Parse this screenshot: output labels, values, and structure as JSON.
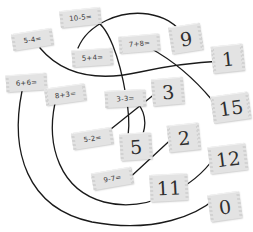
{
  "worksheet": {
    "kind": "math-matching-exercise",
    "ink_color": "#1a1a1a",
    "card_color": "#e3e3e3",
    "text_color": "#3b3b3b"
  },
  "equation_cards": [
    {
      "id": "eq-10-5",
      "label": "10-5=",
      "x": 60,
      "y": 9,
      "rot": -6
    },
    {
      "id": "eq-5-4",
      "label": "5-4=",
      "x": 12,
      "y": 31,
      "rot": -9
    },
    {
      "id": "eq-5p4",
      "label": "5+4=",
      "x": 72,
      "y": 49,
      "rot": -4
    },
    {
      "id": "eq-7p8",
      "label": "7+8=",
      "x": 119,
      "y": 35,
      "rot": -5
    },
    {
      "id": "eq-6p6",
      "label": "6+6=",
      "x": 6,
      "y": 74,
      "rot": -4
    },
    {
      "id": "eq-8p3",
      "label": "8+3=",
      "x": 45,
      "y": 86,
      "rot": -8
    },
    {
      "id": "eq-3-3",
      "label": "3-3=",
      "x": 105,
      "y": 90,
      "rot": -3
    },
    {
      "id": "eq-5-2",
      "label": "5-2=",
      "x": 72,
      "y": 130,
      "rot": -9
    },
    {
      "id": "eq-9-7",
      "label": "9-7=",
      "x": 92,
      "y": 170,
      "rot": -10
    }
  ],
  "answer_cards": [
    {
      "id": "ans-9",
      "label": "9",
      "x": 170,
      "y": 25,
      "rot": -9,
      "wide": false
    },
    {
      "id": "ans-1",
      "label": "1",
      "x": 212,
      "y": 45,
      "rot": -6,
      "wide": false
    },
    {
      "id": "ans-3",
      "label": "3",
      "x": 152,
      "y": 78,
      "rot": -5,
      "wide": false
    },
    {
      "id": "ans-15",
      "label": "15",
      "x": 212,
      "y": 94,
      "rot": -8,
      "wide": true
    },
    {
      "id": "ans-5",
      "label": "5",
      "x": 120,
      "y": 133,
      "rot": -4,
      "wide": false
    },
    {
      "id": "ans-2",
      "label": "2",
      "x": 168,
      "y": 124,
      "rot": -6,
      "wide": false
    },
    {
      "id": "ans-12",
      "label": "12",
      "x": 209,
      "y": 145,
      "rot": -7,
      "wide": true
    },
    {
      "id": "ans-11",
      "label": "11",
      "x": 150,
      "y": 174,
      "rot": -3,
      "wide": true
    },
    {
      "id": "ans-0",
      "label": "0",
      "x": 209,
      "y": 193,
      "rot": -8,
      "wide": false
    }
  ],
  "connections": [
    {
      "id": "link-10-5-to-5",
      "from": "10-5=",
      "to": "5",
      "path": "M 92,20 C 108,22 120,60 126,96 C 131,124 128,133 128,136"
    },
    {
      "id": "link-5p4-to-9",
      "from": "5+4=",
      "to": "9",
      "path": "M 78,48 C 88,24 120,10 148,14 C 166,17 174,24 180,30"
    },
    {
      "id": "link-7p8-to-15",
      "from": "7+8=",
      "to": "15",
      "path": "M 150,48 C 172,60 192,76 212,100"
    },
    {
      "id": "link-5-4-to-1",
      "from": "5-4=",
      "to": "1",
      "path": "M 40,48 C 62,74 96,82 140,72 C 176,64 202,62 222,61"
    },
    {
      "id": "link-3-3-to-5",
      "from": "3-3=",
      "to": "5",
      "path": "M 131,99 C 142,104 148,118 143,134 C 140,142 139,144 138,146"
    },
    {
      "id": "link-5-2-to-3",
      "from": "5-2=",
      "to": "3",
      "path": "M 101,137 L 166,85"
    },
    {
      "id": "link-9-7-to-2",
      "from": "9-7=",
      "to": "2",
      "path": "M 125,182 L 178,133"
    },
    {
      "id": "link-8p3-to-12",
      "from": "8+3=",
      "to": "12",
      "path": "M 55,103 C 46,146 60,190 104,202 C 150,214 196,184 214,158"
    },
    {
      "id": "link-6p6-to-0",
      "from": "6+6=",
      "to": "0",
      "path": "M 22,91 C 10,150 26,208 92,222 C 156,234 198,214 216,198"
    }
  ]
}
